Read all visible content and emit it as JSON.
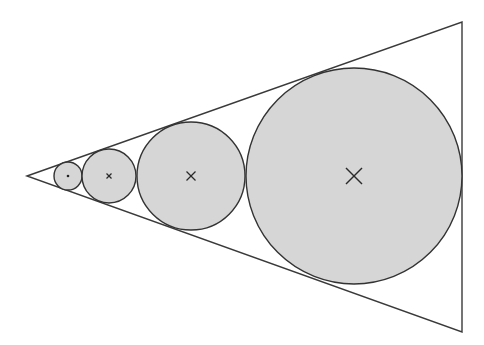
{
  "figure": {
    "colors": {
      "line": "#333333",
      "circle_fill": "#d6d6d6",
      "background": "#ffffff"
    },
    "triangle": {
      "label": "wedge",
      "vertices_count": 3
    },
    "circles": [
      {
        "label": "circle-1",
        "relative_radius": 1,
        "center_marker": "dot"
      },
      {
        "label": "circle-2",
        "relative_radius": 2,
        "center_marker": "small-cross"
      },
      {
        "label": "circle-3",
        "relative_radius": 4,
        "center_marker": "cross"
      },
      {
        "label": "circle-4",
        "relative_radius": 8,
        "center_marker": "large-cross"
      }
    ]
  }
}
